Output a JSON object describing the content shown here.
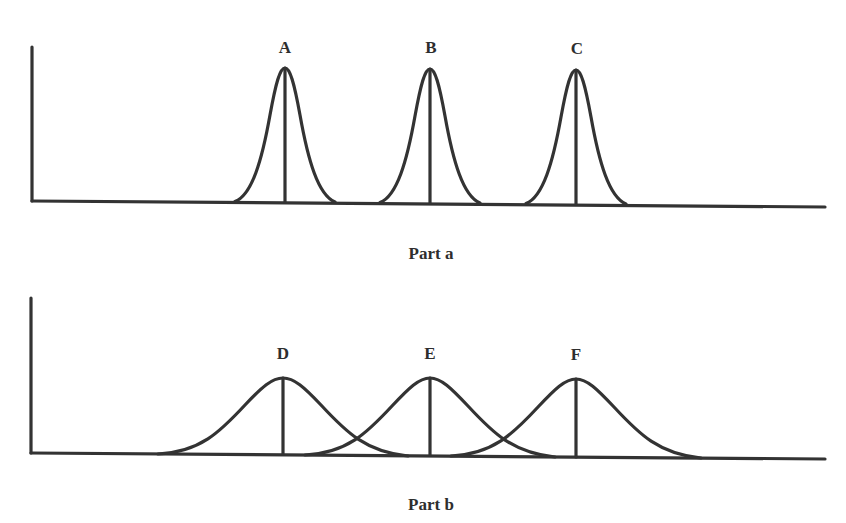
{
  "diagram": {
    "type": "distribution-comparison",
    "line_color": "#333333",
    "panels": [
      {
        "id": "part-a",
        "caption": "Part a",
        "peaks": [
          {
            "label": "A",
            "center_x": 285,
            "half_width": 50
          },
          {
            "label": "B",
            "center_x": 430,
            "half_width": 50
          },
          {
            "label": "C",
            "center_x": 576,
            "half_width": 50
          }
        ],
        "description": "Three narrow, well-separated bell curves"
      },
      {
        "id": "part-b",
        "caption": "Part b",
        "peaks": [
          {
            "label": "D",
            "center_x": 283,
            "half_width": 125
          },
          {
            "label": "E",
            "center_x": 430,
            "half_width": 125
          },
          {
            "label": "F",
            "center_x": 576,
            "half_width": 125
          }
        ],
        "description": "Three wide, overlapping bell curves"
      }
    ]
  }
}
